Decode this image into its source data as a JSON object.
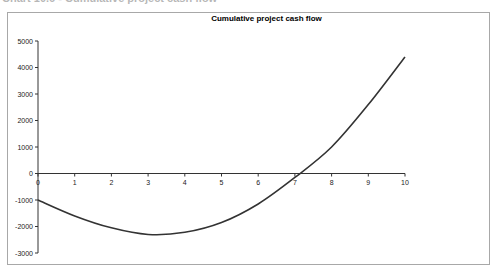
{
  "page_header": "Chart 10.6 - Cumulative project cash flow",
  "chart_data": {
    "type": "line",
    "title": "Cumulative project cash flow",
    "xlabel": "",
    "ylabel": "",
    "x": [
      0,
      1,
      2,
      3,
      4,
      5,
      6,
      7,
      8,
      9,
      10
    ],
    "series": [
      {
        "name": "Cumulative project cash flow",
        "values": [
          -1000,
          -1600,
          -2050,
          -2300,
          -2220,
          -1850,
          -1150,
          -150,
          1000,
          2600,
          4400
        ]
      }
    ],
    "xlim": [
      0,
      10
    ],
    "ylim": [
      -3000,
      5000
    ],
    "x_ticks": [
      "0",
      "1",
      "2",
      "3",
      "4",
      "5",
      "6",
      "7",
      "8",
      "9",
      "10"
    ],
    "y_ticks": [
      "5000",
      "4000",
      "3000",
      "2000",
      "1000",
      "0",
      "-1000",
      "-2000",
      "-3000"
    ],
    "grid": false,
    "legend": "none",
    "line_color": "#333333"
  }
}
